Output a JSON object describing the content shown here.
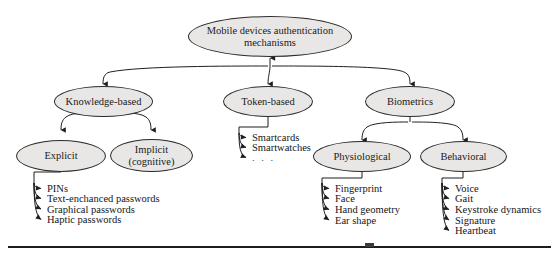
{
  "diagram": {
    "type": "hierarchy-tree",
    "title": "Mobile devices authentication mechanisms",
    "root": {
      "label": "Mobile devices authentication mechanisms",
      "line1": "Mobile devices authentication",
      "line2": "mechanisms"
    },
    "level1": [
      {
        "label": "Knowledge-based"
      },
      {
        "label": "Token-based"
      },
      {
        "label": "Biometrics"
      }
    ],
    "knowledge_children": [
      {
        "line1": "Explicit",
        "line2": ""
      },
      {
        "line1": "Implicit",
        "line2": "(cognitive)"
      }
    ],
    "explicit_leaves": [
      "PINs",
      "Text-enchanced passwords",
      "Graphical passwords",
      "Haptic passwords"
    ],
    "token_leaves": [
      "Smartcards",
      "Smartwatches",
      ". . ."
    ],
    "biometrics_children": [
      {
        "label": "Physiological"
      },
      {
        "label": "Behavioral"
      }
    ],
    "physiological_leaves": [
      "Fingerprint",
      "Face",
      "Hand geometry",
      "Ear shape"
    ],
    "behavioral_leaves": [
      "Voice",
      "Gait",
      "Keystroke dynamics",
      "Signature",
      "Heartbeat"
    ],
    "colors": {
      "node_fill": "#e9e7e5",
      "node_stroke": "#2b2b2b",
      "edge": "#1f1f1f",
      "text": "#151515",
      "background": "#ffffff",
      "rule": "#1d1d1d"
    }
  }
}
